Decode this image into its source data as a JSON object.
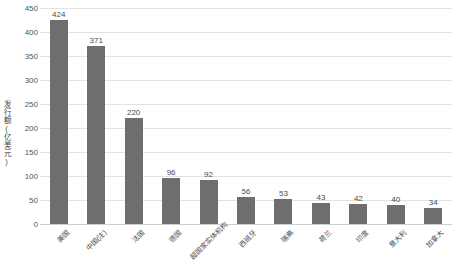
{
  "chart_data": {
    "type": "bar",
    "title": "",
    "subtitle": "",
    "xlabel": "",
    "ylabel": "发行额(亿美元)",
    "ylim": [
      0,
      450
    ],
    "ytick_step": 50,
    "yticks": [
      450,
      400,
      350,
      300,
      250,
      200,
      150,
      100,
      50,
      0
    ],
    "grid": true,
    "legend": false,
    "legend_position": "none",
    "bar_color": "#6e6e6e",
    "gridline_color": "#e2e2e2",
    "background_color": "#ffffff",
    "categories": [
      "美国",
      "中国(注)",
      "法国",
      "德国",
      "超国家实体机构",
      "西班牙",
      "瑞典",
      "荷兰",
      "印度",
      "意大利",
      "加拿大"
    ],
    "values": [
      424,
      371,
      220,
      96,
      92,
      56,
      53,
      43,
      42,
      40,
      34
    ],
    "value_labels": [
      "424",
      "371",
      "220",
      "96",
      "92",
      "56",
      "53",
      "43",
      "42",
      "40",
      "34"
    ]
  }
}
